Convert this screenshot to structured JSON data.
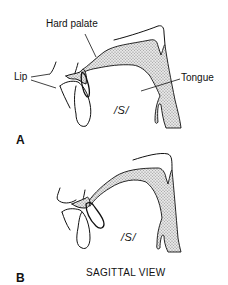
{
  "figure": {
    "caption": "SAGITTAL VIEW",
    "panels": [
      {
        "letter": "A",
        "phoneme": "/S/",
        "labels": {
          "hard_palate": "Hard palate",
          "lip": "Lip",
          "tongue": "Tongue"
        }
      },
      {
        "letter": "B",
        "phoneme": "/S/"
      }
    ]
  },
  "colors": {
    "line": "#111111",
    "stipple": "#bdbdbd",
    "background": "#ffffff"
  }
}
